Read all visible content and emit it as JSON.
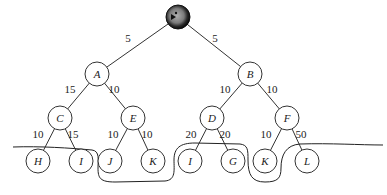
{
  "root": {
    "id": "S",
    "label": "",
    "icon": "pacman-icon",
    "x": 178,
    "y": 17,
    "r": 12
  },
  "nodes": [
    {
      "id": "A",
      "label": "A",
      "x": 97,
      "y": 74
    },
    {
      "id": "B",
      "label": "B",
      "x": 250,
      "y": 74
    },
    {
      "id": "C",
      "label": "C",
      "x": 60,
      "y": 118
    },
    {
      "id": "E",
      "label": "E",
      "x": 133,
      "y": 118
    },
    {
      "id": "D",
      "label": "D",
      "x": 212,
      "y": 118
    },
    {
      "id": "F",
      "label": "F",
      "x": 287,
      "y": 118
    },
    {
      "id": "H",
      "label": "H",
      "x": 38,
      "y": 161
    },
    {
      "id": "I1",
      "label": "I",
      "x": 81,
      "y": 161
    },
    {
      "id": "J",
      "label": "J",
      "x": 110,
      "y": 161
    },
    {
      "id": "K1",
      "label": "K",
      "x": 153,
      "y": 161
    },
    {
      "id": "I2",
      "label": "I",
      "x": 190,
      "y": 161
    },
    {
      "id": "G",
      "label": "G",
      "x": 233,
      "y": 161
    },
    {
      "id": "K2",
      "label": "K",
      "x": 265,
      "y": 161
    },
    {
      "id": "L",
      "label": "L",
      "x": 307,
      "y": 161
    }
  ],
  "node_radius": 12,
  "edges": [
    {
      "from": "S",
      "to": "A",
      "weight": "5",
      "lx": 128,
      "ly": 42
    },
    {
      "from": "S",
      "to": "B",
      "weight": "5",
      "lx": 215,
      "ly": 42
    },
    {
      "from": "A",
      "to": "C",
      "weight": "15",
      "lx": 70,
      "ly": 93
    },
    {
      "from": "A",
      "to": "E",
      "weight": "10",
      "lx": 114,
      "ly": 93
    },
    {
      "from": "B",
      "to": "D",
      "weight": "10",
      "lx": 225,
      "ly": 93
    },
    {
      "from": "B",
      "to": "F",
      "weight": "10",
      "lx": 272,
      "ly": 93
    },
    {
      "from": "C",
      "to": "H",
      "weight": "10",
      "lx": 38,
      "ly": 138
    },
    {
      "from": "C",
      "to": "I1",
      "weight": "15",
      "lx": 73,
      "ly": 138
    },
    {
      "from": "E",
      "to": "J",
      "weight": "10",
      "lx": 113,
      "ly": 138
    },
    {
      "from": "E",
      "to": "K1",
      "weight": "10",
      "lx": 147,
      "ly": 138
    },
    {
      "from": "D",
      "to": "I2",
      "weight": "20",
      "lx": 191,
      "ly": 138
    },
    {
      "from": "D",
      "to": "G",
      "weight": "20",
      "lx": 225,
      "ly": 138
    },
    {
      "from": "F",
      "to": "K2",
      "weight": "10",
      "lx": 266,
      "ly": 138
    },
    {
      "from": "F",
      "to": "L",
      "weight": "50",
      "lx": 301,
      "ly": 138
    }
  ],
  "cut_curve": {
    "path": "M 13 147 C 40 146, 70 148, 92 150 C 100 151, 98 160, 98 168 C 98 178, 100 182, 115 182 L 165 181 C 176 180, 174 170, 174 160 C 174 148, 180 143, 195 143 L 240 144 C 248 145, 248 150, 248 160 C 248 175, 252 182, 265 182 C 278 182, 281 178, 281 168 C 281 155, 286 145, 300 144 C 330 143, 360 145, 383 145"
  },
  "colors": {
    "root_fill_outer": "#111111",
    "root_fill_inner": "#8a8a8a",
    "stroke": "#333333",
    "background": "#ffffff"
  }
}
